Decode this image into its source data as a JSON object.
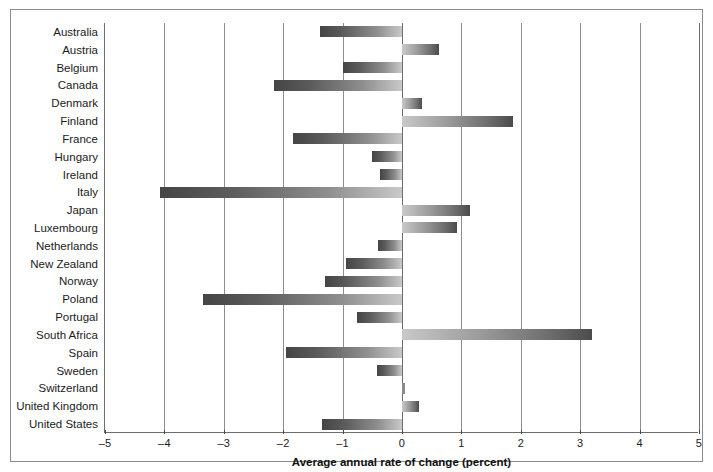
{
  "chart_data": {
    "type": "bar",
    "orientation": "horizontal",
    "title": "",
    "xlabel": "Average annual rate of change (percent)",
    "ylabel": "",
    "xlim": [
      -5,
      5
    ],
    "xticks": [
      "–5",
      "–4",
      "–3",
      "–2",
      "–1",
      "0",
      "1",
      "2",
      "3",
      "4",
      "5"
    ],
    "xtick_values": [
      -5,
      -4,
      -3,
      -2,
      -1,
      0,
      1,
      2,
      3,
      4,
      5
    ],
    "grid": "vertical",
    "legend": "none",
    "categories": [
      "Australia",
      "Austria",
      "Belgium",
      "Canada",
      "Denmark",
      "Finland",
      "France",
      "Hungary",
      "Ireland",
      "Italy",
      "Japan",
      "Luxembourg",
      "Netherlands",
      "New Zealand",
      "Norway",
      "Poland",
      "Portugal",
      "South Africa",
      "Spain",
      "Sweden",
      "Switzerland",
      "United Kingdom",
      "United States"
    ],
    "values": [
      -1.38,
      0.62,
      -1.0,
      -2.15,
      0.33,
      1.87,
      -1.83,
      -0.5,
      -0.37,
      -4.07,
      1.15,
      0.92,
      -0.4,
      -0.95,
      -1.3,
      -3.35,
      -0.75,
      3.2,
      -1.95,
      -0.42,
      0.05,
      0.28,
      -1.35
    ]
  },
  "axis": {
    "x_title": "Average annual rate of change (percent)"
  }
}
